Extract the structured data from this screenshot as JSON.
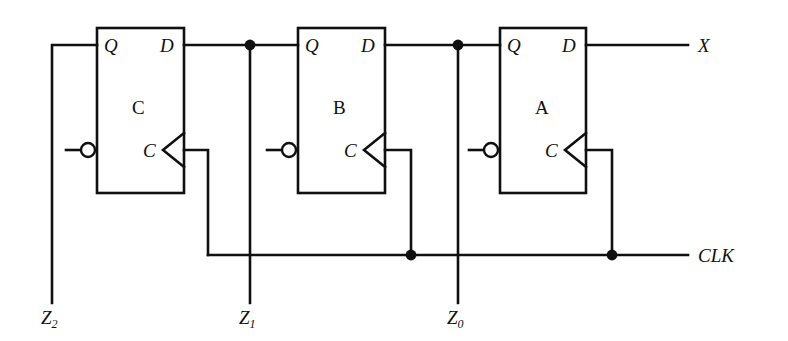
{
  "figure": {
    "kind": "logic-circuit-schematic",
    "stroke_color": "#101010",
    "background_color": "#ffffff",
    "width": 788,
    "height": 341
  },
  "flipflops": [
    {
      "id": "ff-c",
      "name": "C",
      "q_label": "Q",
      "d_label": "D",
      "clk_label": "C",
      "box": {
        "x": 97,
        "y": 28,
        "w": 87,
        "h": 165
      }
    },
    {
      "id": "ff-b",
      "name": "B",
      "q_label": "Q",
      "d_label": "D",
      "clk_label": "C",
      "box": {
        "x": 298,
        "y": 28,
        "w": 87,
        "h": 165
      }
    },
    {
      "id": "ff-a",
      "name": "A",
      "q_label": "Q",
      "d_label": "D",
      "clk_label": "C",
      "box": {
        "x": 500,
        "y": 28,
        "w": 86,
        "h": 165
      }
    }
  ],
  "signals": {
    "x_output": "X",
    "clock": "CLK",
    "z2": {
      "letter": "Z",
      "subscript": "2"
    },
    "z1": {
      "letter": "Z",
      "subscript": "1"
    },
    "z0": {
      "letter": "Z",
      "subscript": "0"
    }
  },
  "geometry": {
    "data_line_y": 45,
    "clock_bus_y": 255,
    "clock_pin_y": 150,
    "z2_x": 52,
    "z1_x": 250,
    "z0_x": 458,
    "clk_drop_c_x": 208,
    "clk_drop_b_x": 411,
    "clk_drop_a_x": 612,
    "bottom_y": 303,
    "x_end": 688,
    "clk_end": 688
  },
  "junction_dots": [
    {
      "name": "z1-data-tap",
      "x": 250,
      "y": 45
    },
    {
      "name": "z0-data-tap",
      "x": 458,
      "y": 45
    },
    {
      "name": "ffb-clock-tap",
      "x": 411,
      "y": 255
    },
    {
      "name": "ffa-clock-tap",
      "x": 612,
      "y": 255
    }
  ]
}
